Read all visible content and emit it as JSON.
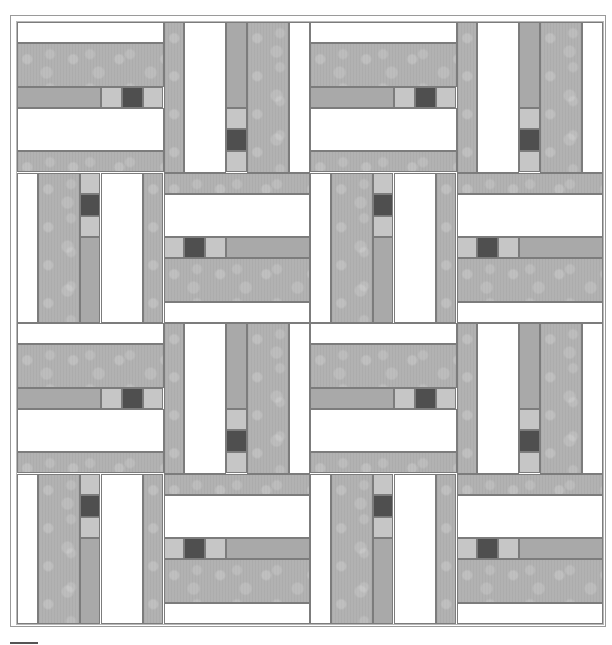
{
  "diagram": {
    "type": "quilt-pattern",
    "grid": {
      "rows": 4,
      "cols": 4
    },
    "colors": {
      "white": "#ffffff",
      "mottled": "#b2b2b2",
      "medium": "#a9a9a9",
      "light": "#c6c6c6",
      "dark": "#4f4f4f",
      "border": "#9a9a9a"
    },
    "block_orientations": [
      [
        "horizontal",
        "vertical",
        "horizontal",
        "vertical"
      ],
      [
        "vertical-flip",
        "horizontal-flip",
        "vertical-flip",
        "horizontal-flip"
      ],
      [
        "horizontal",
        "vertical",
        "horizontal",
        "vertical"
      ],
      [
        "vertical-flip",
        "horizontal-flip",
        "vertical-flip",
        "horizontal-flip"
      ]
    ]
  }
}
